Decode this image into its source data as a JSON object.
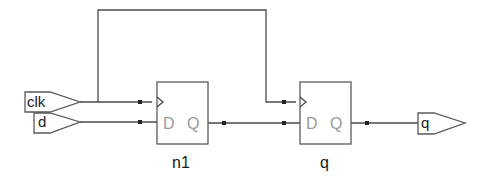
{
  "diagram": {
    "type": "schematic",
    "inputs": [
      {
        "name": "clk",
        "label": "clk"
      },
      {
        "name": "d",
        "label": "d"
      }
    ],
    "outputs": [
      {
        "name": "q",
        "label": "q"
      }
    ],
    "cells": [
      {
        "instance": "n1",
        "label": "n1",
        "pins": {
          "d": "D",
          "q": "Q"
        }
      },
      {
        "instance": "q",
        "label": "q",
        "pins": {
          "d": "D",
          "q": "Q"
        }
      }
    ],
    "nets": [
      {
        "from": "clk",
        "to": [
          "n1.clk",
          "q.clk"
        ]
      },
      {
        "from": "d",
        "to": [
          "n1.D"
        ]
      },
      {
        "from": "n1.Q",
        "to": [
          "q.D"
        ]
      },
      {
        "from": "q.Q",
        "to": [
          "q"
        ]
      }
    ]
  }
}
